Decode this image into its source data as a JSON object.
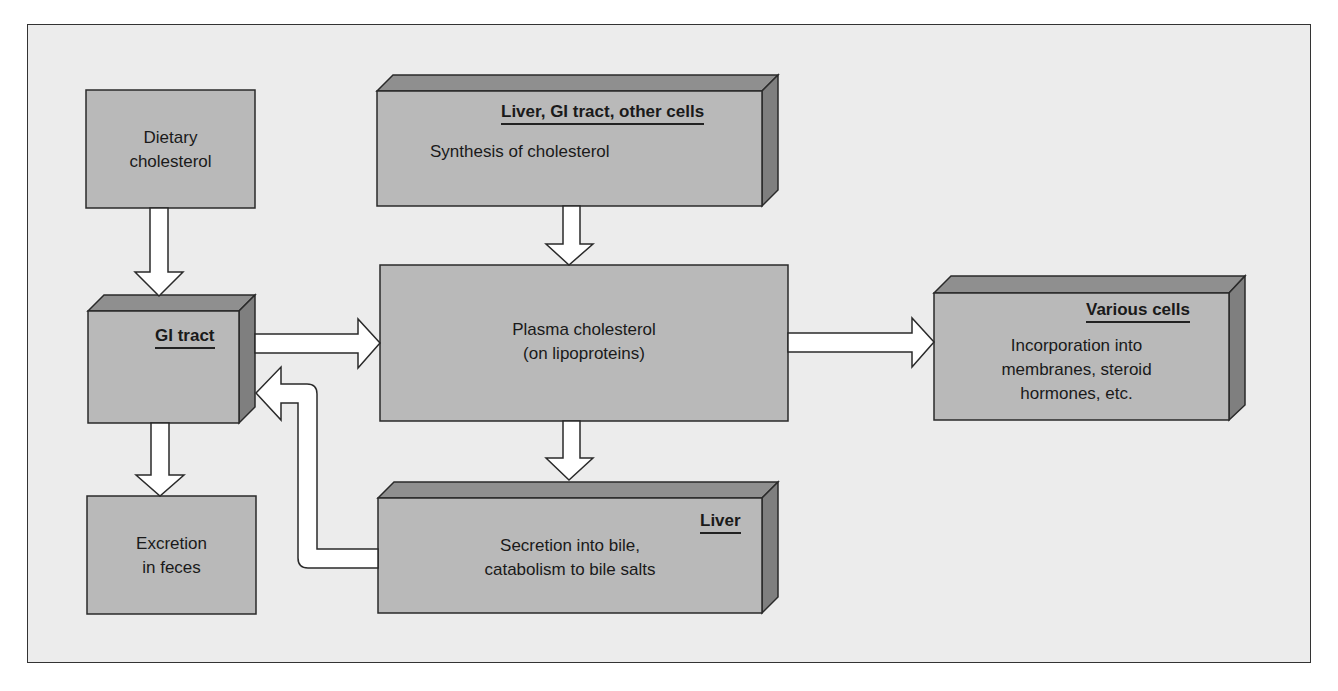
{
  "diagram": {
    "colors": {
      "background": "#ececec",
      "box_face": "#b9b9b9",
      "box_top": "#8f8f8f",
      "box_side": "#7f7f7f",
      "arrow_fill": "#ffffff",
      "stroke": "#2a2a2a"
    },
    "nodes": {
      "dietary": {
        "lines": [
          "Dietary",
          "cholesterol"
        ]
      },
      "gi_tract": {
        "location": "GI tract",
        "lines": []
      },
      "excretion": {
        "lines": [
          "Excretion",
          "in feces"
        ]
      },
      "synthesis": {
        "location": "Liver, GI tract, other cells",
        "lines": [
          "Synthesis of cholesterol"
        ]
      },
      "plasma": {
        "lines": [
          "Plasma cholesterol",
          "(on lipoproteins)"
        ]
      },
      "liver": {
        "location": "Liver",
        "lines": [
          "Secretion into bile,",
          "catabolism to bile salts"
        ]
      },
      "various": {
        "location": "Various cells",
        "lines": [
          "Incorporation into",
          "membranes, steroid",
          "hormones, etc."
        ]
      }
    },
    "edges": [
      {
        "from": "Dietary cholesterol",
        "to": "GI tract"
      },
      {
        "from": "GI tract",
        "to": "Plasma cholesterol"
      },
      {
        "from": "GI tract",
        "to": "Excretion in feces"
      },
      {
        "from": "Synthesis of cholesterol",
        "to": "Plasma cholesterol"
      },
      {
        "from": "Plasma cholesterol",
        "to": "Various cells"
      },
      {
        "from": "Plasma cholesterol",
        "to": "Liver"
      },
      {
        "from": "Liver",
        "to": "GI tract"
      }
    ]
  }
}
